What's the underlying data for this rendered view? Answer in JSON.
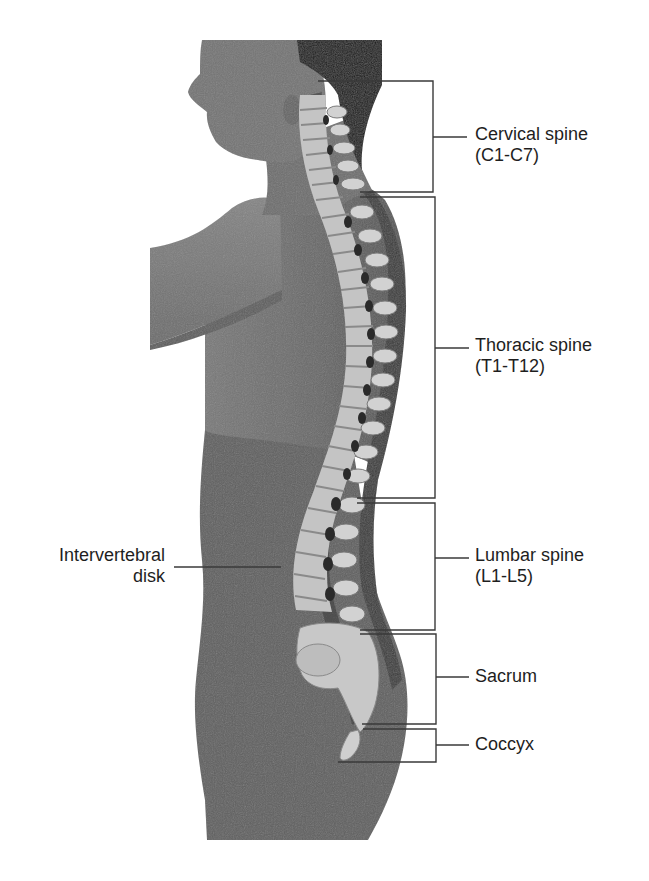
{
  "figure": {
    "colors": {
      "background": "#ffffff",
      "body_skin": "#6f6f6f",
      "body_shadow": "#4a4a4a",
      "hair": "#1c1c1c",
      "bone": "#c9c9c9",
      "bone_highlight": "#e2e2e2",
      "leader_line": "#3a3a3a",
      "label_text": "#1e1e1e"
    }
  },
  "labels": {
    "cervical": {
      "line1": "Cervical spine",
      "line2": "(C1-C7)"
    },
    "thoracic": {
      "line1": "Thoracic spine",
      "line2": "(T1-T12)"
    },
    "lumbar": {
      "line1": "Lumbar spine",
      "line2": "(L1-L5)"
    },
    "sacrum": {
      "line1": "Sacrum"
    },
    "coccyx": {
      "line1": "Coccyx"
    },
    "disk": {
      "line1": "Intervertebral",
      "line2": "disk"
    }
  },
  "brackets": [
    {
      "region": "cervical",
      "top": 81,
      "bottom": 192,
      "label_y": 137
    },
    {
      "region": "thoracic",
      "top": 197,
      "bottom": 498,
      "label_y": 347
    },
    {
      "region": "lumbar",
      "top": 503,
      "bottom": 630,
      "label_y": 557
    },
    {
      "region": "sacrum",
      "top": 634,
      "bottom": 725,
      "label_y": 677
    },
    {
      "region": "coccyx",
      "top": 730,
      "bottom": 762,
      "label_y": 745
    }
  ]
}
